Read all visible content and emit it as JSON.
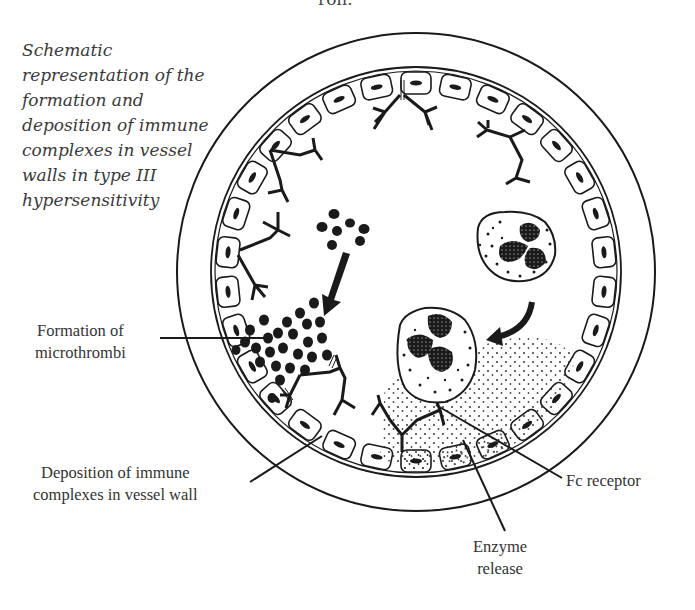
{
  "header": {
    "clipped_text": "ron."
  },
  "caption": {
    "lines": [
      "Schematic",
      "representation of the",
      "formation and",
      "deposition of immune",
      "complexes in vessel",
      "walls in type III",
      "hypersensitivity"
    ]
  },
  "labels": {
    "microthrombi": [
      "Formation of",
      "microthrombi"
    ],
    "deposition": [
      "Deposition of immune",
      "complexes in vessel wall"
    ],
    "fc_receptor": [
      "Fc receptor"
    ],
    "enzyme": [
      "Enzyme",
      "release"
    ]
  },
  "diagram": {
    "vessel": {
      "cx": 416,
      "cy": 272,
      "outer_r": 239,
      "inner_r": 205
    },
    "colors": {
      "line": "#1a1a1a",
      "fill": "#ffffff",
      "text": "#333333"
    }
  }
}
